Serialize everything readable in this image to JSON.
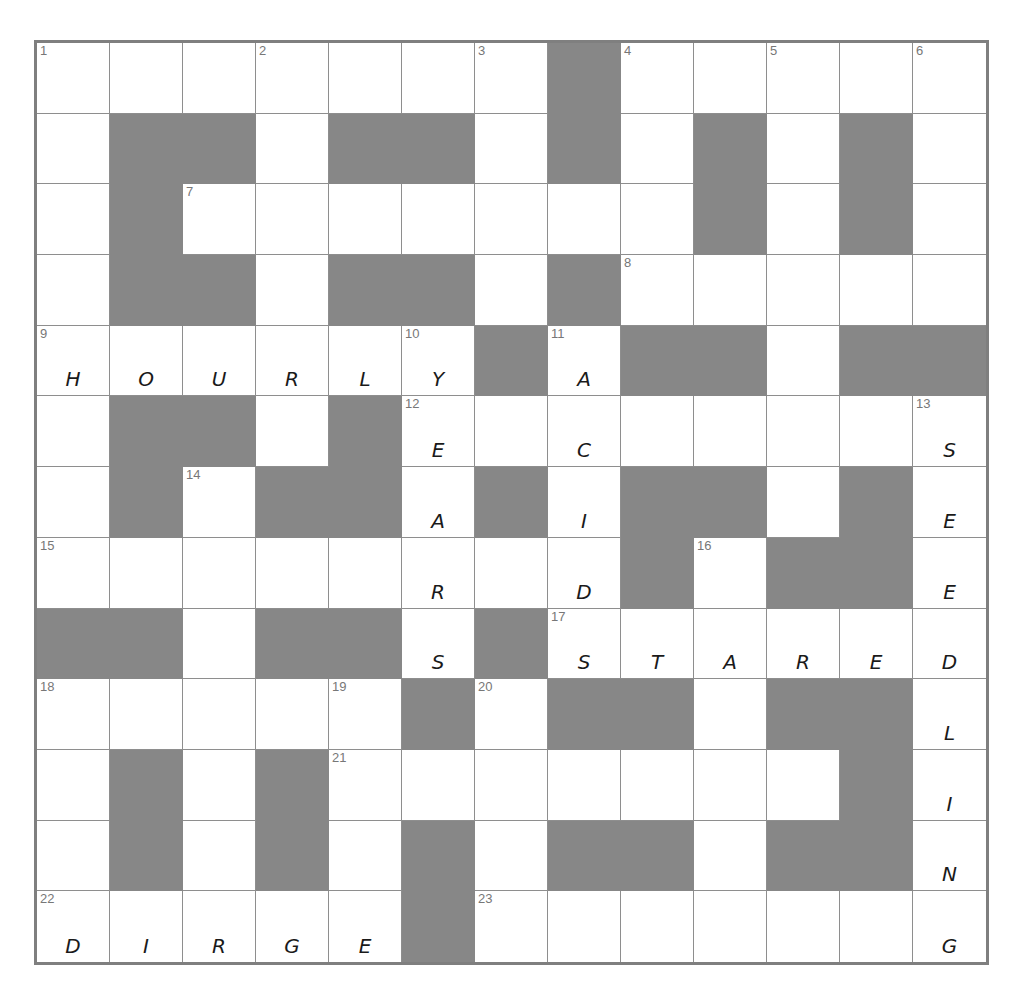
{
  "puzzle": {
    "rows": 13,
    "cols": 13,
    "colors": {
      "block": "#878787",
      "cell": "#ffffff",
      "line": "#8e8e8e",
      "number": "#777777",
      "ink": "#1a1a1a"
    },
    "layout": [
      "1111111011111",
      "1001001010101",
      "1011111110101",
      "1001001011111",
      "1111110100100",
      "1001011111111",
      "1010010100101",
      "1111111101001",
      "0010010111111",
      "1111101001001",
      "1010111111101",
      "1010101001001",
      "1111101111111"
    ],
    "numbers": {
      "0,0": "1",
      "0,3": "2",
      "0,6": "3",
      "0,8": "4",
      "0,10": "5",
      "0,12": "6",
      "2,2": "7",
      "3,8": "8",
      "4,0": "9",
      "4,5": "10",
      "4,7": "11",
      "5,5": "12",
      "5,12": "13",
      "6,2": "14",
      "7,0": "15",
      "7,9": "16",
      "8,7": "17",
      "9,0": "18",
      "9,4": "19",
      "9,6": "20",
      "10,4": "21",
      "12,0": "22",
      "12,6": "23"
    },
    "letters": {
      "4,0": "H",
      "4,1": "O",
      "4,2": "U",
      "4,3": "R",
      "4,4": "L",
      "4,5": "Y",
      "5,5": "E",
      "6,5": "A",
      "7,5": "R",
      "8,5": "S",
      "4,7": "A",
      "5,7": "C",
      "6,7": "I",
      "7,7": "D",
      "8,7": "S",
      "8,8": "T",
      "8,9": "A",
      "8,10": "R",
      "8,11": "E",
      "8,12": "D",
      "5,12": "S",
      "6,12": "E",
      "7,12": "E",
      "9,12": "L",
      "10,12": "I",
      "11,12": "N",
      "12,12": "G",
      "12,0": "D",
      "12,1": "I",
      "12,2": "R",
      "12,3": "G",
      "12,4": "E"
    },
    "filled_entries": [
      {
        "clue": "9 across",
        "answer": "HOURLY"
      },
      {
        "clue": "10 down",
        "answer": "YEARS"
      },
      {
        "clue": "11 down",
        "answer": "ACID"
      },
      {
        "clue": "17 across",
        "answer": "STARED"
      },
      {
        "clue": "13 down",
        "answer": "SEEDLING"
      },
      {
        "clue": "22 across",
        "answer": "DIRGE"
      }
    ]
  }
}
